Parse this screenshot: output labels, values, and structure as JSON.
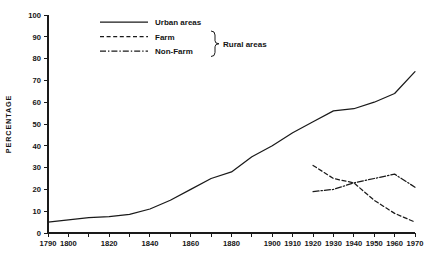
{
  "chart_data": {
    "type": "line",
    "title": "",
    "xlabel": "",
    "ylabel": "PERCENTAGE",
    "xlim": [
      1790,
      1970
    ],
    "ylim": [
      0,
      100
    ],
    "grid": false,
    "legend_position": "top-center",
    "y_ticks": [
      0,
      10,
      20,
      30,
      40,
      50,
      60,
      70,
      80,
      90,
      100
    ],
    "x_ticks": [
      1790,
      1800,
      1810,
      1820,
      1830,
      1840,
      1850,
      1860,
      1870,
      1880,
      1890,
      1900,
      1910,
      1920,
      1930,
      1940,
      1950,
      1960,
      1970
    ],
    "x_tick_labels": [
      "1790",
      "1800",
      "",
      "1820",
      "",
      "1840",
      "",
      "1860",
      "",
      "1880",
      "",
      "1900",
      "1910",
      "1920",
      "1930",
      "1940",
      "1950",
      "1960",
      "1970"
    ],
    "series": [
      {
        "name": "Urban areas",
        "style": "solid",
        "x": [
          1790,
          1800,
          1810,
          1820,
          1830,
          1840,
          1850,
          1860,
          1870,
          1880,
          1890,
          1900,
          1910,
          1920,
          1930,
          1940,
          1950,
          1960,
          1970
        ],
        "values": [
          5,
          6,
          7,
          7.5,
          8.5,
          11,
          15,
          20,
          25,
          28,
          35,
          40,
          46,
          51,
          56,
          57,
          60,
          64,
          74
        ]
      },
      {
        "name": "Farm",
        "style": "dashed",
        "x": [
          1920,
          1930,
          1940,
          1950,
          1960,
          1970
        ],
        "values": [
          31,
          25,
          23,
          15,
          9,
          5
        ]
      },
      {
        "name": "Non-Farm",
        "style": "dash-dot",
        "x": [
          1920,
          1930,
          1940,
          1950,
          1960,
          1970
        ],
        "values": [
          19,
          20,
          23,
          25,
          27,
          21
        ]
      }
    ],
    "legend_group_label": "Rural areas",
    "legend_group_members": [
      "Farm",
      "Non-Farm"
    ]
  },
  "legend": {
    "entries": [
      {
        "label": "Urban areas",
        "style": "solid"
      },
      {
        "label": "Farm",
        "style": "dashed"
      },
      {
        "label": "Non-Farm",
        "style": "dash-dot"
      }
    ],
    "group_label": "Rural areas"
  },
  "colors": {
    "ink": "#1a1a1a",
    "background": "#ffffff"
  }
}
